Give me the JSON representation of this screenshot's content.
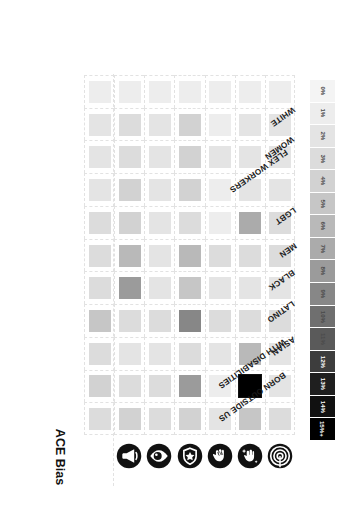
{
  "chart_data": {
    "type": "heatmap",
    "title": "",
    "column_label": "ACE Bias",
    "xlabel": "",
    "ylabel": "",
    "grid": true,
    "legend_position": "right",
    "unit": "%",
    "columns": [
      {
        "id": "col-target",
        "icon": "target-bullseye-icon",
        "label": ""
      },
      {
        "id": "col-hand-sparkle",
        "icon": "hand-sparkle-icon",
        "label": ""
      },
      {
        "id": "col-open-palm",
        "icon": "open-palm-icon",
        "label": ""
      },
      {
        "id": "col-shield-badge",
        "icon": "shield-badge-icon",
        "label": ""
      },
      {
        "id": "col-eye",
        "icon": "eye-icon",
        "label": ""
      },
      {
        "id": "col-megaphone",
        "icon": "megaphone-icon",
        "label": ""
      },
      {
        "id": "col-ace-bias",
        "icon": "",
        "label": "ACE Bias"
      }
    ],
    "categories": [
      "BORN OUTSIDE US",
      "WITH DISABILITIES",
      "ASIAN",
      "LATINO",
      "BLACK",
      "MEN",
      "LGBT",
      "FLEX WORKERS",
      "WOMEN",
      "WHITE",
      ""
    ],
    "values": [
      [
        3,
        5,
        2,
        4,
        3,
        4,
        3
      ],
      [
        2,
        15,
        1,
        8,
        3,
        3,
        4
      ],
      [
        2,
        6,
        2,
        3,
        2,
        2,
        3
      ],
      [
        3,
        3,
        3,
        9,
        3,
        3,
        5
      ],
      [
        2,
        2,
        2,
        5,
        2,
        8,
        3
      ],
      [
        3,
        3,
        3,
        6,
        2,
        6,
        3
      ],
      [
        3,
        7,
        1,
        3,
        2,
        4,
        3
      ],
      [
        2,
        2,
        1,
        4,
        2,
        4,
        2
      ],
      [
        2,
        2,
        2,
        4,
        2,
        3,
        2
      ],
      [
        2,
        2,
        1,
        4,
        2,
        3,
        2
      ],
      [
        1,
        1,
        1,
        1,
        1,
        1,
        1
      ]
    ],
    "legend": {
      "scale_label": "",
      "entries": [
        {
          "label": "15%+",
          "color": "#000000"
        },
        {
          "label": "14%",
          "color": "#111111"
        },
        {
          "label": "13%",
          "color": "#1f1f1f"
        },
        {
          "label": "12%",
          "color": "#3d3d3d"
        },
        {
          "label": "11%",
          "color": "#5a5a5a"
        },
        {
          "label": "10%",
          "color": "#6f6f6f"
        },
        {
          "label": "9%",
          "color": "#878787"
        },
        {
          "label": "8%",
          "color": "#9b9b9b"
        },
        {
          "label": "7%",
          "color": "#ababab"
        },
        {
          "label": "6%",
          "color": "#b9b9b9"
        },
        {
          "label": "5%",
          "color": "#c6c6c6"
        },
        {
          "label": "4%",
          "color": "#d2d2d2"
        },
        {
          "label": "3%",
          "color": "#dcdcdc"
        },
        {
          "label": "2%",
          "color": "#e4e4e4"
        },
        {
          "label": "1%",
          "color": "#ededed"
        },
        {
          "label": "0%",
          "color": "#f4f4f4"
        }
      ]
    },
    "colors": {
      "grid_line": "#e2e2e2",
      "text": "#1a1a1a",
      "background": "#ffffff",
      "max": "#000000",
      "min": "#f4f4f4"
    }
  }
}
